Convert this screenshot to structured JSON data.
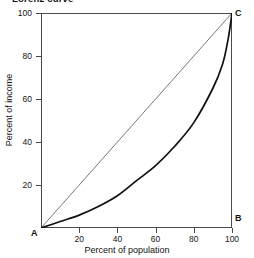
{
  "chart_data": {
    "type": "line",
    "title": "Lorenz curve",
    "xlabel": "Percent of population",
    "ylabel": "Percent of income",
    "xlim": [
      0,
      100
    ],
    "ylim": [
      0,
      100
    ],
    "xticks": [
      20,
      40,
      60,
      80,
      100
    ],
    "yticks": [
      20,
      40,
      60,
      80,
      100
    ],
    "grid": false,
    "legend": "none",
    "series": [
      {
        "name": "Line of equality",
        "style": "thin-straight",
        "x": [
          0,
          100
        ],
        "values": [
          0,
          100
        ]
      },
      {
        "name": "Lorenz curve",
        "style": "thick-curve",
        "x": [
          0,
          10,
          20,
          30,
          40,
          50,
          60,
          70,
          80,
          90,
          95,
          98,
          100
        ],
        "values": [
          0,
          3,
          6,
          10,
          15,
          22,
          29,
          38,
          49,
          65,
          76,
          88,
          100
        ]
      }
    ],
    "annotations": [
      {
        "label": "A",
        "x": 0,
        "y": 0,
        "position": "bottom-left"
      },
      {
        "label": "B",
        "x": 100,
        "y": 0,
        "position": "bottom-right"
      },
      {
        "label": "C",
        "x": 100,
        "y": 100,
        "position": "top-right"
      }
    ],
    "colors": {
      "axis": "#4a4a4a",
      "equality_line": "#555555",
      "lorenz_curve": "#111111",
      "background": "#ffffff"
    }
  }
}
